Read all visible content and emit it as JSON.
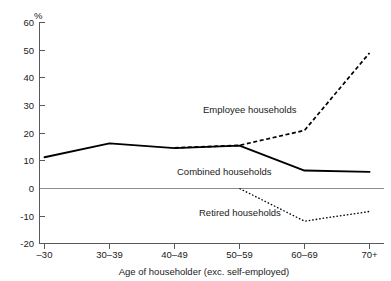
{
  "chart_data": {
    "type": "line",
    "title": "",
    "xlabel": "Age of householder (exc. self-employed)",
    "ylabel": "%",
    "categories": [
      "–30",
      "30–39",
      "40–49",
      "50–59",
      "60–69",
      "70+"
    ],
    "yticks": [
      60,
      50,
      40,
      30,
      20,
      10,
      0,
      -10,
      -20
    ],
    "ytick_labels": [
      "60",
      "50",
      "40",
      "30",
      "20",
      "10",
      "0",
      "-10",
      "-20"
    ],
    "ylim": [
      -20,
      60
    ],
    "grid": false,
    "legend_position": "inline-annotations",
    "series": [
      {
        "name": "Employee households",
        "style": "dashed",
        "label_text": "Employee households",
        "values": [
          null,
          null,
          14.7,
          15.6,
          21.0,
          49.0
        ]
      },
      {
        "name": "Combined households",
        "style": "solid",
        "label_text": "Combined households",
        "values": [
          11.3,
          16.3,
          14.6,
          15.5,
          6.5,
          6.0
        ]
      },
      {
        "name": "Retired households",
        "style": "dotted",
        "label_text": "Retired households",
        "values": [
          null,
          null,
          null,
          0.0,
          -11.8,
          -8.3
        ]
      }
    ],
    "annotations": [
      {
        "text": "Employee households",
        "series": "Employee households"
      },
      {
        "text": "Combined households",
        "series": "Combined households"
      },
      {
        "text": "Retired households",
        "series": "Retired households"
      }
    ]
  }
}
